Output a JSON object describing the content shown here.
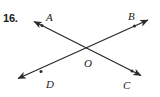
{
  "figure": {
    "problem_number": "16.",
    "stroke_color": "#2b2b2b",
    "background_color": "#ffffff",
    "width": 160,
    "height": 97
  },
  "labels": {
    "a": "A",
    "b": "B",
    "c": "C",
    "d": "D",
    "o": "O"
  },
  "geometry": {
    "intersection": {
      "x": 86,
      "y": 54
    },
    "lines": [
      {
        "name": "line-db",
        "from": {
          "label": "D",
          "x": 15,
          "y": 80
        },
        "to": {
          "label": "B",
          "x": 151,
          "y": 18
        },
        "arrow_both_ends": true
      },
      {
        "name": "line-ac",
        "from": {
          "label": "A",
          "x": 31,
          "y": 20
        },
        "to": {
          "label": "C",
          "x": 144,
          "y": 77
        },
        "arrow_both_ends": true
      }
    ],
    "markers": [
      {
        "name": "point-a",
        "x": 42,
        "y": 25
      },
      {
        "name": "point-b",
        "x": 135,
        "y": 25
      },
      {
        "name": "point-c",
        "x": 133,
        "y": 72
      },
      {
        "name": "point-d",
        "x": 41,
        "y": 72
      }
    ]
  }
}
